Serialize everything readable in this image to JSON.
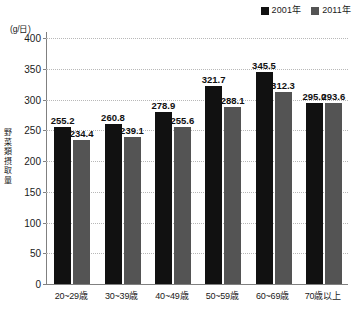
{
  "chart_data": {
    "type": "bar",
    "title": "",
    "subtitle": "",
    "xlabel": "",
    "ylabel": "野菜類摂取量",
    "unit_caption": "(g/日)",
    "ylim": [
      0,
      400
    ],
    "yticks": [
      0,
      50,
      100,
      150,
      200,
      250,
      300,
      350,
      400
    ],
    "ytick_labels": [
      "0",
      "50",
      "100",
      "150",
      "200",
      "250",
      "300",
      "350",
      "400"
    ],
    "grid": true,
    "grid_style": "dotted-horizontal",
    "legend_position": "top-right",
    "categories": [
      "20~29歳",
      "30~39歳",
      "40~49歳",
      "50~59歳",
      "60~69歳",
      "70歳以上"
    ],
    "series": [
      {
        "name": "2001年",
        "color": "#111111",
        "values": [
          255.2,
          260.8,
          278.9,
          321.7,
          345.5,
          295.0
        ],
        "labels": [
          "255.2",
          "260.8",
          "278.9",
          "321.7",
          "345.5",
          "295.0"
        ]
      },
      {
        "name": "2011年",
        "color": "#545454",
        "values": [
          234.4,
          239.1,
          255.6,
          288.1,
          312.3,
          293.6
        ],
        "labels": [
          "234.4",
          "239.1",
          "255.6",
          "288.1",
          "312.3",
          "293.6"
        ]
      }
    ]
  },
  "legend": {
    "entries": [
      {
        "label": "2001年",
        "swatch": "#111111",
        "icon": "square-marker-icon"
      },
      {
        "label": "2011年",
        "swatch": "#545454",
        "icon": "square-marker-icon"
      }
    ]
  }
}
